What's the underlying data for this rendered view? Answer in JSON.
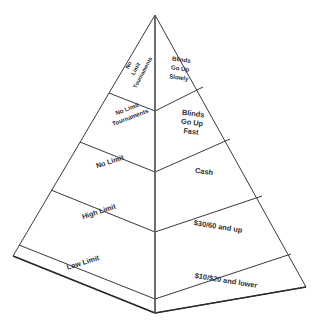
{
  "figure": {
    "name": "poker-game-pyramid",
    "background_color": "#ffffff",
    "line_color": "#3a3a3a",
    "text_color": "#2e2e2e"
  },
  "geometry": {
    "apex": {
      "x": 155,
      "y": 15
    },
    "base_left": {
      "x": 13,
      "y": 256
    },
    "base_front": {
      "x": 155,
      "y": 313
    },
    "base_right": {
      "x": 306,
      "y": 287
    },
    "spine_top": {
      "x": 155,
      "y": 15
    },
    "spine_bottom": {
      "x": 155,
      "y": 313
    },
    "tier_count": 5,
    "left_face_text_rotation_deg": -15,
    "right_face_text_rotation_deg": 9
  },
  "tiers": [
    {
      "index": 0,
      "name": "tier-no-limit-tournaments-slow",
      "left_label": "No Limit Tournaments",
      "left_lines": [
        "No",
        "Limit",
        "Tournaments"
      ],
      "right_label": "Blinds Go Up Slowly",
      "right_lines": [
        "Blinds",
        "Go Up",
        "Slowly"
      ],
      "spine_y_top": 15,
      "spine_y_bottom": 93
    },
    {
      "index": 1,
      "name": "tier-no-limit-tournaments-fast",
      "left_label": "No Limit Tournaments",
      "left_lines": [
        "No Limit",
        "Tournaments"
      ],
      "right_label": "Blinds Go Up Fast",
      "right_lines": [
        "Blinds",
        "Go Up",
        "Fast"
      ],
      "spine_y_top": 93,
      "spine_y_bottom": 142
    },
    {
      "index": 2,
      "name": "tier-no-limit-cash",
      "left_label": "No Limit",
      "left_lines": [
        "No Limit"
      ],
      "right_label": "Cash",
      "right_lines": [
        "Cash"
      ],
      "spine_y_top": 142,
      "spine_y_bottom": 190
    },
    {
      "index": 3,
      "name": "tier-high-limit",
      "left_label": "High Limit",
      "left_lines": [
        "High Limit"
      ],
      "right_label": "$30/60 and up",
      "right_lines": [
        "$30/60 and up"
      ],
      "spine_y_top": 190,
      "spine_y_bottom": 243
    },
    {
      "index": 4,
      "name": "tier-low-limit",
      "left_label": "Low Limit",
      "left_lines": [
        "Low Limit"
      ],
      "right_label": "$10/$20 and lower",
      "right_lines": [
        "$10/$20 and lower"
      ],
      "spine_y_top": 243,
      "spine_y_bottom": 313
    }
  ]
}
